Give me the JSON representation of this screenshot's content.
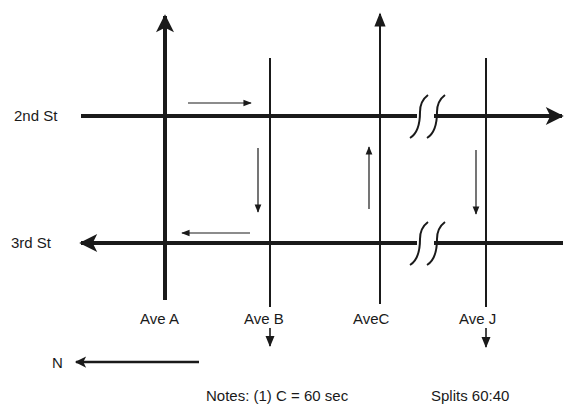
{
  "diagram": {
    "type": "street-network",
    "streets": [
      {
        "name": "2nd St",
        "direction": "eastbound (arrow right)",
        "label": "2nd St"
      },
      {
        "name": "3rd St",
        "direction": "westbound (arrow left)",
        "label": "3rd St"
      }
    ],
    "avenues": [
      {
        "name": "Ave A",
        "label": "Ave A",
        "direction": "two-way major (arrow up)"
      },
      {
        "name": "Ave B",
        "label": "Ave B",
        "direction": "one-way down"
      },
      {
        "name": "AveC",
        "label": "AveC",
        "direction": "one-way up"
      },
      {
        "name": "Ave J",
        "label": "Ave J",
        "direction": "one-way down"
      }
    ],
    "north_label": "N",
    "break_symbol": "road continues (break)"
  },
  "notes": {
    "prefix": "Notes: (1) C = 60 sec",
    "splits": "Splits 60:40"
  },
  "colors": {
    "ink": "#1a1a1a",
    "background": "#ffffff"
  }
}
